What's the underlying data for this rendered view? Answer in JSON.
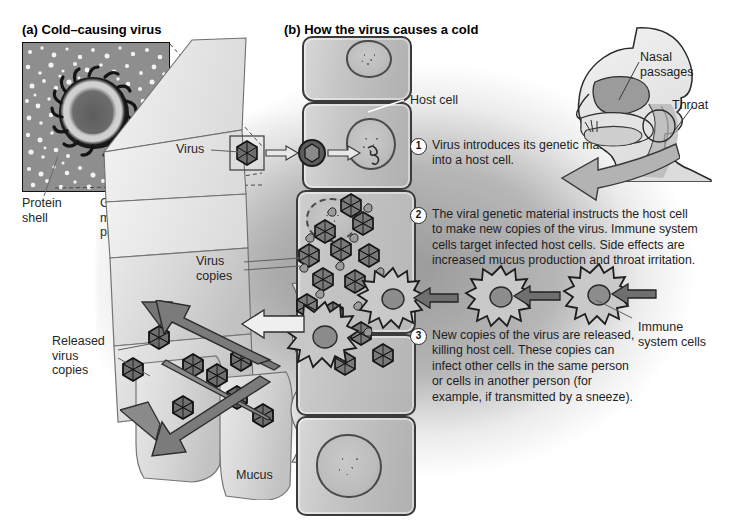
{
  "figure": {
    "panel_a": {
      "title": "(a) Cold–causing virus",
      "labels": {
        "protein_shell": "Protein\nshell",
        "genetic_material": "Genetic\nmaterial and\nproteins"
      },
      "micrograph_alt": "electron-micrograph-of-cold-virus"
    },
    "panel_b": {
      "title": "(b) How the virus causes a cold",
      "labels": {
        "virus": "Virus",
        "host_cell": "Host cell",
        "virus_copies": "Virus\ncopies",
        "released_virus_copies": "Released\nvirus\ncopies",
        "mucus": "Mucus",
        "immune_system_cells": "Immune\nsystem cells"
      },
      "head_labels": {
        "nasal_passages": "Nasal\npassages",
        "throat": "Throat"
      },
      "steps": [
        {
          "number": "1",
          "text": "Virus introduces its genetic material into a host cell."
        },
        {
          "number": "2",
          "text": "The viral genetic material instructs the host cell to make new copies of the virus. Immune system cells target infected host cells. Side effects are increased mucus production and throat irritation."
        },
        {
          "number": "3",
          "text": "New copies of the virus are released, killing host cell.  These copies can infect other cells in the same person or cells in another person (for example, if transmitted by a sneeze)."
        }
      ]
    },
    "colors": {
      "ink": "#1a1a1a",
      "outline": "#3b3b3b",
      "cell_fill": "#c6c6c6",
      "background": "#ffffff",
      "gray_wash": "#9e9e9e"
    }
  }
}
